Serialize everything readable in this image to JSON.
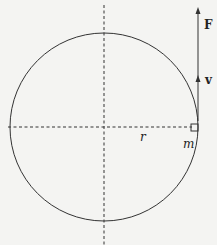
{
  "diagram": {
    "type": "uniform-circular-motion",
    "labels": {
      "force": "F",
      "velocity": "v",
      "radius": "r",
      "mass": "m"
    },
    "colors": {
      "background": "#f4f4f2",
      "stroke": "#333333"
    },
    "circle": {
      "cx": 104,
      "cy": 127,
      "r": 94
    },
    "axes": {
      "vertical_dashed": {
        "x": 104,
        "y1": 5,
        "y2": 245
      },
      "horizontal_dashed": {
        "y": 127,
        "x1": 8,
        "x2": 192
      }
    },
    "vectors": [
      {
        "name": "F",
        "x": 198,
        "from_y": 120,
        "to_y": 8
      },
      {
        "name": "v",
        "x": 198,
        "from_y": 120,
        "to_y": 77
      }
    ]
  }
}
